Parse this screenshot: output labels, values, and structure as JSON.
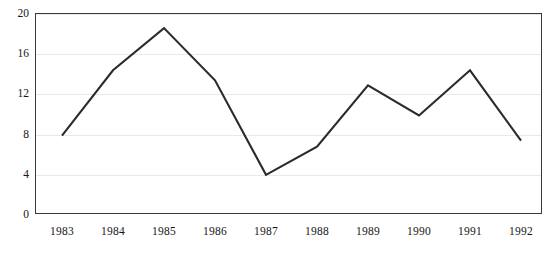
{
  "chart_data": {
    "type": "line",
    "title": "",
    "subtitle": "",
    "xlabel": "",
    "ylabel": "",
    "categories": [
      "1983",
      "1984",
      "1985",
      "1986",
      "1987",
      "1988",
      "1989",
      "1990",
      "1991",
      "1992"
    ],
    "values": [
      7.8,
      14.3,
      18.5,
      13.3,
      3.9,
      6.7,
      12.8,
      9.8,
      14.3,
      7.3
    ],
    "series": [
      {
        "name": "series-1",
        "values": [
          7.8,
          14.3,
          18.5,
          13.3,
          3.9,
          6.7,
          12.8,
          9.8,
          14.3,
          7.3
        ]
      }
    ],
    "ylim": [
      0,
      20
    ],
    "yticks": [
      0,
      4,
      8,
      12,
      16,
      20
    ],
    "ytick_labels": [
      "0",
      "4",
      "8",
      "12",
      "16",
      "20"
    ],
    "xtick_labels": [
      "1983",
      "1984",
      "1985",
      "1986",
      "1987",
      "1988",
      "1989",
      "1990",
      "1991",
      "1992"
    ],
    "grid": true,
    "grid_axis": "y",
    "legend": false,
    "legend_position": "none",
    "line_color": "#2b2b2b",
    "grid_color": "#e9e9e9",
    "frame_color": "#3a3a3a",
    "background_color": "#ffffff",
    "markers": false,
    "annotations": []
  }
}
